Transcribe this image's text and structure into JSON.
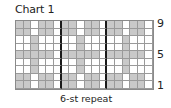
{
  "title": "Chart 1",
  "row_labels": [
    {
      "label": "9",
      "row": 9
    },
    {
      "label": "5",
      "row": 5
    },
    {
      "label": "1",
      "row": 1
    }
  ],
  "repeat_label": "6-st repeat",
  "colors": {
    "shaded": "#c9c9c9",
    "blank": "#ffffff",
    "gridline": "#9a9a9a",
    "repeat_line": "#1a1a1a"
  },
  "chart_data": {
    "type": "heatmap",
    "title": "Chart 1",
    "columns": 18,
    "rows": 9,
    "repeat_width": 6,
    "repeat_boundaries_after_columns": [
      6,
      12
    ],
    "row_labels_shown": [
      "9",
      "5",
      "1"
    ],
    "bottom_label": "6-st repeat",
    "legend": {
      "1": "shaded (gray) square",
      "0": "blank (white) square"
    },
    "repeat_pattern_rows_top_to_bottom": [
      [
        1,
        1,
        0,
        1,
        1,
        0
      ],
      [
        1,
        1,
        0,
        1,
        1,
        0
      ],
      [
        0,
        0,
        1,
        0,
        0,
        0
      ],
      [
        0,
        0,
        1,
        0,
        0,
        0
      ],
      [
        1,
        1,
        1,
        1,
        1,
        0
      ],
      [
        0,
        0,
        1,
        0,
        0,
        0
      ],
      [
        0,
        0,
        1,
        0,
        0,
        0
      ],
      [
        1,
        1,
        0,
        1,
        1,
        0
      ],
      [
        1,
        1,
        0,
        1,
        1,
        0
      ]
    ],
    "row_numbers_top_to_bottom": [
      9,
      8,
      7,
      6,
      5,
      4,
      3,
      2,
      1
    ]
  }
}
